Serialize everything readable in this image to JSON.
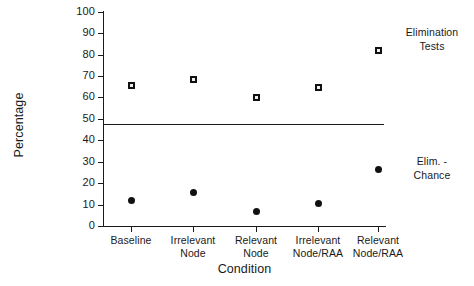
{
  "chart_data": {
    "type": "scatter",
    "title": "",
    "xlabel": "Condition",
    "ylabel": "Percentage",
    "ylim": [
      0,
      100
    ],
    "yticks": [
      0,
      10,
      20,
      30,
      40,
      50,
      60,
      70,
      80,
      90,
      100
    ],
    "grid": false,
    "legend_position": "right",
    "categories": [
      "Baseline",
      "Irrelevant Node",
      "Relevant Node",
      "Irrelevant Node/RAA",
      "Relevant Node/RAA"
    ],
    "category_lines": [
      [
        "Baseline",
        ""
      ],
      [
        "Irrelevant",
        "Node"
      ],
      [
        "Relevant",
        "Node"
      ],
      [
        "Irrelevant",
        "Node/RAA"
      ],
      [
        "Relevant",
        "Node/RAA"
      ]
    ],
    "series": [
      {
        "name": "Elimination Tests",
        "marker": "square",
        "values": [
          65.5,
          68.5,
          60,
          64.5,
          82
        ]
      },
      {
        "name": "Elim. - Chance",
        "marker": "circle",
        "values": [
          12,
          15.5,
          7,
          10.5,
          26.5
        ]
      }
    ],
    "reference_line": {
      "value": 47.7,
      "label": ""
    },
    "series_labels": [
      {
        "lines": [
          "Elimination",
          "Tests"
        ]
      },
      {
        "lines": [
          "Elim. -",
          "Chance"
        ]
      }
    ],
    "axis_color": "#1a1a1a"
  },
  "yticks": {
    "t0": "0",
    "t1": "10",
    "t2": "20",
    "t3": "30",
    "t4": "40",
    "t5": "50",
    "t6": "60",
    "t7": "70",
    "t8": "80",
    "t9": "90",
    "t10": "100"
  },
  "xticks": {
    "c0_l1": "Baseline",
    "c0_l2": "",
    "c1_l1": "Irrelevant",
    "c1_l2": "Node",
    "c2_l1": "Relevant",
    "c2_l2": "Node",
    "c3_l1": "Irrelevant",
    "c3_l2": "Node/RAA",
    "c4_l1": "Relevant",
    "c4_l2": "Node/RAA"
  },
  "axes": {
    "ylabel": "Percentage",
    "xlabel": "Condition"
  },
  "legend": {
    "s0_l1": "Elimination",
    "s0_l2": "Tests",
    "s1_l1": "Elim. -",
    "s1_l2": "Chance"
  }
}
